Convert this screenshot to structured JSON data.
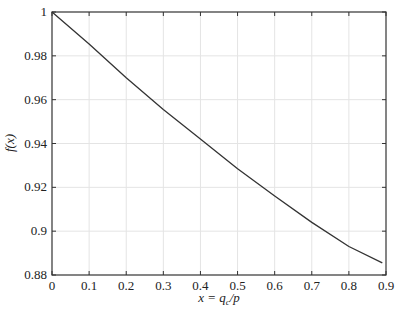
{
  "chart_data": {
    "type": "line",
    "title": "",
    "xlabel": "x = q_c/p",
    "ylabel": "f(x)",
    "xlim": [
      0,
      0.9
    ],
    "ylim": [
      0.88,
      1.0
    ],
    "grid": true,
    "legend": null,
    "x_ticks": [
      0,
      0.1,
      0.2,
      0.3,
      0.4,
      0.5,
      0.6,
      0.7,
      0.8,
      0.9
    ],
    "x_tick_labels": [
      "0",
      "0.1",
      "0.2",
      "0.3",
      "0.4",
      "0.5",
      "0.6",
      "0.7",
      "0.8",
      "0.9"
    ],
    "y_ticks": [
      0.88,
      0.9,
      0.92,
      0.94,
      0.96,
      0.98,
      1.0
    ],
    "y_tick_labels": [
      "0.88",
      "0.9",
      "0.92",
      "0.94",
      "0.96",
      "0.98",
      "1"
    ],
    "series": [
      {
        "name": "f(x)",
        "color": "#333333",
        "x": [
          0,
          0.1,
          0.2,
          0.3,
          0.4,
          0.5,
          0.6,
          0.7,
          0.8,
          0.89
        ],
        "values": [
          1.0,
          0.9854,
          0.97,
          0.9555,
          0.942,
          0.9285,
          0.916,
          0.904,
          0.893,
          0.8855
        ]
      }
    ]
  },
  "axes": {
    "xlabel_main": "x = q",
    "xlabel_sub": "c",
    "xlabel_tail": "/p",
    "ylabel": "f(x)"
  }
}
